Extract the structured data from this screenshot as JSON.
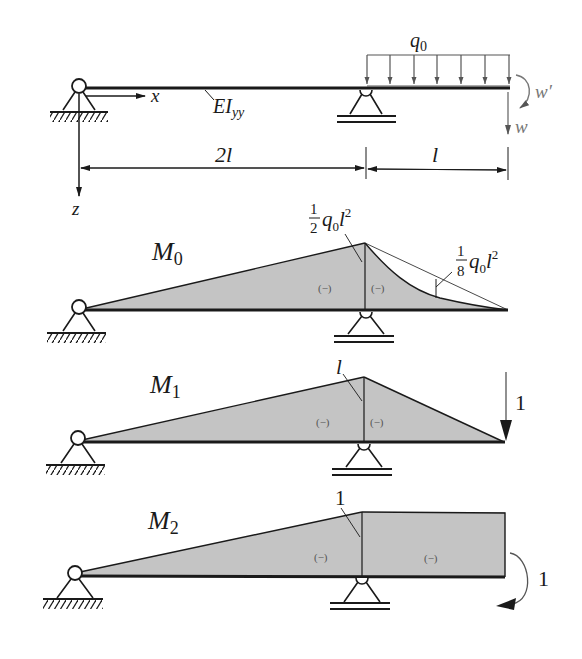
{
  "figure": {
    "beam": {
      "stiffness_label": "EI",
      "stiffness_sub": "yy",
      "x_axis": "x",
      "z_axis": "z",
      "load_label": "q",
      "load_sub": "0",
      "w_prime": "w′",
      "w": "w",
      "span_left": "2l",
      "span_right": "l"
    },
    "m0": {
      "title": "M",
      "title_sub": "0",
      "peak_label_num": "1",
      "peak_label_den": "2",
      "peak_label_q": "q",
      "peak_label_qsub": "0",
      "peak_label_l": "l",
      "peak_label_exp": "2",
      "sag_label_num": "1",
      "sag_label_den": "8",
      "sag_label_q": "q",
      "sag_label_qsub": "0",
      "sag_label_l": "l",
      "sag_label_exp": "2",
      "sign_left": "(−)",
      "sign_right": "(−)"
    },
    "m1": {
      "title": "M",
      "title_sub": "1",
      "peak_label": "l",
      "force_label": "1",
      "sign_left": "(−)",
      "sign_right": "(−)"
    },
    "m2": {
      "title": "M",
      "title_sub": "2",
      "peak_label": "1",
      "moment_label": "1",
      "sign_left": "(−)",
      "sign_right": "(−)"
    },
    "colors": {
      "fill": "#c4c4c4",
      "line": "#1a1a1a",
      "load": "#555555"
    }
  }
}
